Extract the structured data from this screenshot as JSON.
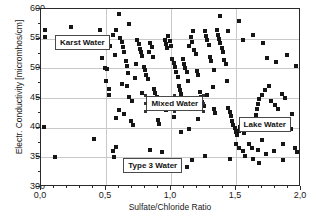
{
  "chart_data": {
    "type": "scatter",
    "title": "",
    "xlabel": "Sulfate/Chloride Ratio",
    "ylabel": "Electr. Conductivity [micromhos/cm]",
    "xlim": [
      0.0,
      2.0
    ],
    "ylim": [
      300,
      600
    ],
    "xticks": [
      "0,0",
      "0,5",
      "1,0",
      "1,5",
      "2,0"
    ],
    "xtick_values": [
      0.0,
      0.5,
      1.0,
      1.5,
      2.0
    ],
    "yticks": [
      "300",
      "350",
      "400",
      "450",
      "500",
      "550",
      "600"
    ],
    "ytick_values": [
      300,
      350,
      400,
      450,
      500,
      550,
      600
    ],
    "grid": true,
    "legend": "none",
    "marker": "square",
    "marker_color": "#161616",
    "annotations": [
      {
        "label": "Karst Water",
        "x": 0.32,
        "y": 543,
        "selected": false
      },
      {
        "label": "Mixed Water",
        "x": 1.03,
        "y": 440,
        "selected": true
      },
      {
        "label": "Lake Water",
        "x": 1.72,
        "y": 406,
        "selected": false
      },
      {
        "label": "Type 3 Water",
        "x": 0.86,
        "y": 336,
        "selected": false
      }
    ],
    "points": [
      [
        0.03,
        565
      ],
      [
        0.03,
        553
      ],
      [
        0.02,
        401
      ],
      [
        0.11,
        350
      ],
      [
        0.23,
        570
      ],
      [
        0.41,
        381
      ],
      [
        0.47,
        518
      ],
      [
        0.49,
        500
      ],
      [
        0.51,
        499
      ],
      [
        0.5,
        478
      ],
      [
        0.52,
        466
      ],
      [
        0.55,
        361
      ],
      [
        0.56,
        351
      ],
      [
        0.58,
        368
      ],
      [
        0.53,
        538
      ],
      [
        0.57,
        523
      ],
      [
        0.6,
        592
      ],
      [
        0.61,
        551
      ],
      [
        0.62,
        545
      ],
      [
        0.63,
        536
      ],
      [
        0.64,
        528
      ],
      [
        0.65,
        512
      ],
      [
        0.66,
        504
      ],
      [
        0.67,
        492
      ],
      [
        0.62,
        474
      ],
      [
        0.66,
        470
      ],
      [
        0.68,
        452
      ],
      [
        0.7,
        445
      ],
      [
        0.69,
        412
      ],
      [
        0.71,
        404
      ],
      [
        0.72,
        344
      ],
      [
        0.74,
        548
      ],
      [
        0.75,
        541
      ],
      [
        0.76,
        533
      ],
      [
        0.77,
        527
      ],
      [
        0.78,
        520
      ],
      [
        0.73,
        508
      ],
      [
        0.79,
        503
      ],
      [
        0.8,
        497
      ],
      [
        0.81,
        489
      ],
      [
        0.82,
        482
      ],
      [
        0.83,
        528
      ],
      [
        0.84,
        543
      ],
      [
        0.85,
        536
      ],
      [
        0.86,
        519
      ],
      [
        0.87,
        466
      ],
      [
        0.88,
        458
      ],
      [
        0.89,
        452
      ],
      [
        0.9,
        413
      ],
      [
        0.91,
        406
      ],
      [
        0.84,
        362
      ],
      [
        0.93,
        359
      ],
      [
        0.95,
        548
      ],
      [
        0.96,
        541
      ],
      [
        0.97,
        534
      ],
      [
        0.98,
        555
      ],
      [
        0.99,
        546
      ],
      [
        1.0,
        538
      ],
      [
        1.01,
        516
      ],
      [
        1.02,
        509
      ],
      [
        1.03,
        502
      ],
      [
        1.04,
        494
      ],
      [
        1.05,
        486
      ],
      [
        1.06,
        470
      ],
      [
        1.07,
        463
      ],
      [
        1.08,
        456
      ],
      [
        1.09,
        516
      ],
      [
        1.1,
        508
      ],
      [
        1.11,
        500
      ],
      [
        1.12,
        493
      ],
      [
        1.13,
        478
      ],
      [
        1.14,
        537
      ],
      [
        1.15,
        552
      ],
      [
        1.16,
        545
      ],
      [
        1.17,
        563
      ],
      [
        1.18,
        531
      ],
      [
        1.19,
        524
      ],
      [
        1.2,
        496
      ],
      [
        1.21,
        489
      ],
      [
        1.22,
        460
      ],
      [
        1.23,
        452
      ],
      [
        1.24,
        444
      ],
      [
        1.25,
        437
      ],
      [
        1.26,
        563
      ],
      [
        1.27,
        555
      ],
      [
        1.28,
        547
      ],
      [
        1.29,
        540
      ],
      [
        1.3,
        519
      ],
      [
        1.31,
        512
      ],
      [
        1.32,
        469
      ],
      [
        1.33,
        431
      ],
      [
        1.34,
        424
      ],
      [
        1.35,
        564
      ],
      [
        1.36,
        556
      ],
      [
        1.37,
        549
      ],
      [
        1.38,
        542
      ],
      [
        1.39,
        535
      ],
      [
        1.4,
        528
      ],
      [
        1.41,
        514
      ],
      [
        1.42,
        507
      ],
      [
        1.43,
        478
      ],
      [
        1.44,
        433
      ],
      [
        1.45,
        426
      ],
      [
        1.46,
        419
      ],
      [
        1.47,
        412
      ],
      [
        1.48,
        405
      ],
      [
        1.49,
        399
      ],
      [
        1.5,
        393
      ],
      [
        1.51,
        388
      ],
      [
        1.52,
        395
      ],
      [
        1.53,
        401
      ],
      [
        1.54,
        399
      ],
      [
        1.55,
        396
      ],
      [
        1.56,
        391
      ],
      [
        1.57,
        397
      ],
      [
        1.58,
        403
      ],
      [
        1.59,
        400
      ],
      [
        1.6,
        398
      ],
      [
        1.61,
        405
      ],
      [
        1.62,
        410
      ],
      [
        1.63,
        407
      ],
      [
        1.64,
        415
      ],
      [
        1.65,
        422
      ],
      [
        1.5,
        372
      ],
      [
        1.52,
        366
      ],
      [
        1.55,
        360
      ],
      [
        1.57,
        353
      ],
      [
        1.6,
        372
      ],
      [
        1.62,
        366
      ],
      [
        1.66,
        432
      ],
      [
        1.67,
        440
      ],
      [
        1.68,
        448
      ],
      [
        1.7,
        455
      ],
      [
        1.72,
        463
      ],
      [
        1.75,
        470
      ],
      [
        1.77,
        445
      ],
      [
        1.8,
        438
      ],
      [
        1.82,
        431
      ],
      [
        1.85,
        457
      ],
      [
        1.88,
        450
      ],
      [
        1.9,
        404
      ],
      [
        1.92,
        397
      ],
      [
        1.95,
        366
      ],
      [
        1.97,
        359
      ],
      [
        1.93,
        423
      ],
      [
        1.86,
        372
      ],
      [
        1.79,
        360
      ],
      [
        1.73,
        355
      ],
      [
        1.67,
        362
      ],
      [
        1.7,
        380
      ],
      [
        1.44,
        563
      ],
      [
        1.55,
        548
      ],
      [
        1.63,
        556
      ],
      [
        1.71,
        543
      ],
      [
        1.38,
        588
      ],
      [
        1.52,
        580
      ],
      [
        1.74,
        518
      ],
      [
        1.81,
        510
      ],
      [
        1.89,
        523
      ],
      [
        1.96,
        504
      ],
      [
        1.33,
        498
      ],
      [
        1.28,
        455
      ],
      [
        1.21,
        415
      ],
      [
        1.14,
        398
      ],
      [
        1.08,
        392
      ],
      [
        1.02,
        418
      ],
      [
        0.96,
        430
      ],
      [
        0.92,
        444
      ],
      [
        0.78,
        459
      ],
      [
        0.72,
        484
      ],
      [
        0.68,
        574
      ],
      [
        0.58,
        565
      ],
      [
        0.55,
        556
      ],
      [
        1.45,
        347
      ],
      [
        1.68,
        340
      ],
      [
        1.26,
        352
      ],
      [
        1.16,
        345
      ],
      [
        0.95,
        334
      ],
      [
        1.12,
        333
      ],
      [
        1.63,
        347
      ],
      [
        1.86,
        345
      ],
      [
        0.6,
        430
      ],
      [
        0.64,
        423
      ],
      [
        0.58,
        417
      ],
      [
        0.52,
        455
      ],
      [
        0.45,
        564
      ]
    ]
  }
}
